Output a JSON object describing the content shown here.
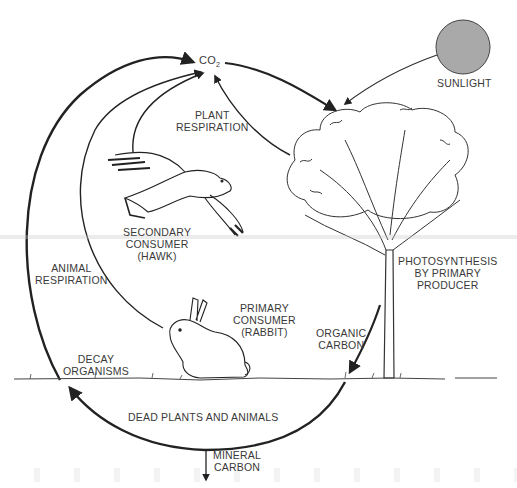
{
  "diagram": {
    "colors": {
      "line": "#222222",
      "sun_fill": "#a9a9a9",
      "text": "#3a3a3a",
      "background": "#ffffff"
    },
    "nodes": {
      "co2": {
        "text": "CO",
        "subscript": "2"
      },
      "sunlight": {
        "label": "SUNLIGHT"
      },
      "plant_respiration": {
        "line1": "PLANT",
        "line2": "RESPIRATION"
      },
      "secondary_consumer": {
        "line1": "SECONDARY",
        "line2": "CONSUMER",
        "line3": "(HAWK)"
      },
      "animal_respiration": {
        "line1": "ANIMAL",
        "line2": "RESPIRATION"
      },
      "photosynthesis": {
        "line1": "PHOTOSYNTHESIS",
        "line2": "BY PRIMARY",
        "line3": "PRODUCER"
      },
      "primary_consumer": {
        "line1": "PRIMARY",
        "line2": "CONSUMER",
        "line3": "(RABBIT)"
      },
      "organic_carbon": {
        "line1": "ORGANIC",
        "line2": "CARBON"
      },
      "decay_organisms": {
        "line1": "DECAY",
        "line2": "ORGANISMS"
      },
      "dead_plants_animals": {
        "label": "DEAD PLANTS AND ANIMALS"
      },
      "mineral_carbon": {
        "line1": "MINERAL",
        "line2": "CARBON"
      }
    },
    "illustrations": [
      "hawk",
      "rabbit",
      "tree",
      "sun",
      "ground"
    ]
  }
}
